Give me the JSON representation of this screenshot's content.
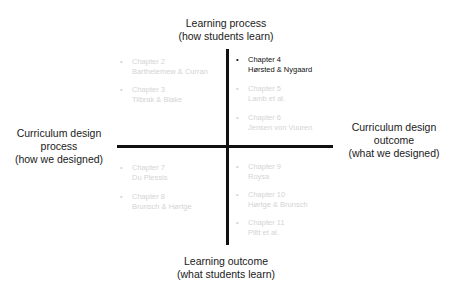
{
  "axes": {
    "top": {
      "line1": "Learning process",
      "line2": "(how students learn)"
    },
    "bottom": {
      "line1": "Learning outcome",
      "line2": "(what students learn)"
    },
    "left": {
      "line1": "Curriculum design",
      "line2": "process",
      "line3": "(how we designed)"
    },
    "right": {
      "line1": "Curriculum design",
      "line2": "outcome",
      "line3": "(what we designed)"
    }
  },
  "colors": {
    "axis": "#111111",
    "active_text": "#111111",
    "dim_text": "#d4d4d4"
  },
  "bullet": "•",
  "chapters": [
    {
      "title": "Chapter 2",
      "authors": "Barthelemew & Curran",
      "quadrant": "top-left",
      "state": "dim"
    },
    {
      "title": "Chapter 3",
      "authors": "Tilbrak & Blake",
      "quadrant": "top-left",
      "state": "dim"
    },
    {
      "title": "Chapter 4",
      "authors": "Hørsted & Nygaard",
      "quadrant": "top-right",
      "state": "active"
    },
    {
      "title": "Chapter 5",
      "authors": "Lamb et al.",
      "quadrant": "top-right",
      "state": "dim"
    },
    {
      "title": "Chapter 6",
      "authors": "Jensen von Vuuren",
      "quadrant": "top-right",
      "state": "dim"
    },
    {
      "title": "Chapter 7",
      "authors": "Du Plessis",
      "quadrant": "bottom-left",
      "state": "dim"
    },
    {
      "title": "Chapter 8",
      "authors": "Brunsch & Hørtge",
      "quadrant": "bottom-left",
      "state": "dim"
    },
    {
      "title": "Chapter 9",
      "authors": "Roysa",
      "quadrant": "bottom-right",
      "state": "dim"
    },
    {
      "title": "Chapter 10",
      "authors": "Hørtge & Brunsch",
      "quadrant": "bottom-right",
      "state": "dim"
    },
    {
      "title": "Chapter 11",
      "authors": "Piltt et al.",
      "quadrant": "bottom-right",
      "state": "dim"
    }
  ]
}
